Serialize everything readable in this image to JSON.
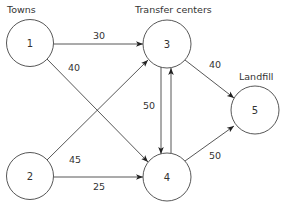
{
  "diagram": {
    "type": "network-flow",
    "group_labels": {
      "towns": "Towns",
      "transfer_centers": "Transfer centers",
      "landfill": "Landfill"
    },
    "nodes": [
      {
        "id": "1",
        "label": "1",
        "group": "towns",
        "cx": 30,
        "cy": 43,
        "r": 23.5
      },
      {
        "id": "2",
        "label": "2",
        "group": "towns",
        "cx": 30,
        "cy": 176,
        "r": 23.5
      },
      {
        "id": "3",
        "label": "3",
        "group": "transfer_centers",
        "cx": 167,
        "cy": 44,
        "r": 24
      },
      {
        "id": "4",
        "label": "4",
        "group": "transfer_centers",
        "cx": 167,
        "cy": 177,
        "r": 24
      },
      {
        "id": "5",
        "label": "5",
        "group": "landfill",
        "cx": 255,
        "cy": 110,
        "r": 24
      }
    ],
    "edges": [
      {
        "from": "1",
        "to": "3",
        "label": "30"
      },
      {
        "from": "1",
        "to": "4",
        "label": "40"
      },
      {
        "from": "2",
        "to": "3",
        "label": "45"
      },
      {
        "from": "2",
        "to": "4",
        "label": "25"
      },
      {
        "from": "3",
        "to": "4",
        "label": "50"
      },
      {
        "from": "4",
        "to": "3",
        "label": ""
      },
      {
        "from": "3",
        "to": "5",
        "label": "40"
      },
      {
        "from": "4",
        "to": "5",
        "label": "50"
      }
    ],
    "colors": {
      "stroke": "#444444",
      "text": "#333333",
      "background": "#ffffff"
    }
  }
}
